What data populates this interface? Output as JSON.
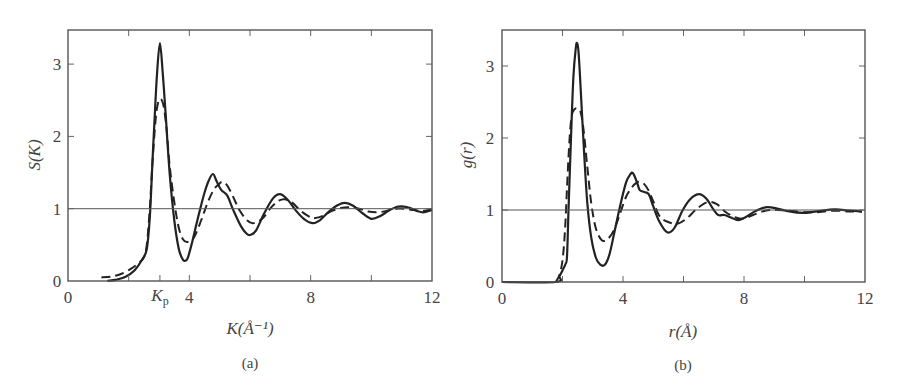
{
  "chart_data": [
    {
      "id": "a",
      "type": "line",
      "title": "",
      "caption": "(a)",
      "xlabel": "K(Å⁻¹)",
      "ylabel": "S(K)",
      "xlim": [
        0,
        12
      ],
      "ylim": [
        0,
        3.45
      ],
      "xticks": [
        0,
        4,
        8,
        12
      ],
      "xtick_labels": [
        "0",
        "4",
        "8",
        "12"
      ],
      "minor_xticks": [
        2,
        4,
        6,
        8,
        10
      ],
      "annotated_xtick": {
        "x": 3.03,
        "label": "K",
        "subscript": "p"
      },
      "yticks": [
        0,
        1,
        2,
        3
      ],
      "ytick_labels": [
        "0",
        "1",
        "2",
        "3"
      ],
      "reference_line": {
        "y": 1
      },
      "grid": false,
      "legend": null,
      "series": [
        {
          "name": "solid",
          "style": "solid",
          "x": [
            1.3,
            1.6,
            1.9,
            2.2,
            2.45,
            2.6,
            2.7,
            2.78,
            2.86,
            2.94,
            3.03,
            3.12,
            3.22,
            3.35,
            3.5,
            3.65,
            3.78,
            3.86,
            3.95,
            4.1,
            4.3,
            4.5,
            4.65,
            4.78,
            4.9,
            5.05,
            5.25,
            5.45,
            5.7,
            5.9,
            6.03,
            6.2,
            6.45,
            6.75,
            7.0,
            7.25,
            7.5,
            7.8,
            8.05,
            8.3,
            8.6,
            8.9,
            9.13,
            9.4,
            9.7,
            10.0,
            10.3,
            10.6,
            10.9,
            11.2,
            11.5,
            11.7,
            11.9,
            12.0
          ],
          "y": [
            0.0,
            0.02,
            0.06,
            0.15,
            0.3,
            0.45,
            0.9,
            1.6,
            2.3,
            2.9,
            3.29,
            2.9,
            2.3,
            1.5,
            0.85,
            0.45,
            0.3,
            0.28,
            0.32,
            0.55,
            0.9,
            1.22,
            1.4,
            1.48,
            1.38,
            1.26,
            1.18,
            0.98,
            0.76,
            0.65,
            0.64,
            0.7,
            0.92,
            1.14,
            1.2,
            1.12,
            0.98,
            0.85,
            0.8,
            0.84,
            0.96,
            1.05,
            1.08,
            1.04,
            0.94,
            0.86,
            0.9,
            0.98,
            1.03,
            1.02,
            0.97,
            0.95,
            0.97,
            0.98
          ]
        },
        {
          "name": "dashed",
          "style": "dashed",
          "x": [
            1.1,
            1.4,
            1.7,
            2.0,
            2.3,
            2.55,
            2.68,
            2.78,
            2.88,
            2.96,
            3.05,
            3.15,
            3.25,
            3.35,
            3.5,
            3.65,
            3.8,
            3.95,
            4.15,
            4.4,
            4.6,
            4.8,
            5.0,
            5.1,
            5.25,
            5.45,
            5.65,
            5.9,
            6.1,
            6.4,
            6.7,
            6.95,
            7.15,
            7.4,
            7.7,
            8.0,
            8.15,
            8.4,
            8.7,
            9.0,
            9.3,
            9.6,
            9.9,
            10.2,
            10.5,
            10.8,
            11.1,
            11.4,
            11.7,
            12.0
          ],
          "y": [
            0.05,
            0.06,
            0.09,
            0.15,
            0.24,
            0.38,
            0.9,
            1.6,
            2.2,
            2.45,
            2.52,
            2.42,
            2.1,
            1.6,
            1.1,
            0.74,
            0.57,
            0.54,
            0.6,
            0.85,
            1.08,
            1.26,
            1.35,
            1.37,
            1.32,
            1.16,
            0.98,
            0.84,
            0.8,
            0.86,
            1.02,
            1.11,
            1.13,
            1.08,
            0.96,
            0.88,
            0.87,
            0.9,
            0.97,
            1.01,
            1.02,
            1.0,
            0.96,
            0.95,
            0.97,
            1.0,
            1.0,
            0.98,
            0.97,
            0.99
          ]
        }
      ]
    },
    {
      "id": "b",
      "type": "line",
      "title": "",
      "caption": "(b)",
      "xlabel": "r(Å)",
      "ylabel": "g(r)",
      "xlim": [
        0,
        12
      ],
      "ylim": [
        0,
        3.45
      ],
      "xticks": [
        0,
        4,
        8,
        12
      ],
      "xtick_labels": [
        "0",
        "4",
        "8",
        "12"
      ],
      "minor_xticks": [
        2,
        4,
        6,
        8,
        10
      ],
      "yticks": [
        0,
        1,
        2,
        3
      ],
      "ytick_labels": [
        "0",
        "1",
        "2",
        "3"
      ],
      "reference_line": {
        "y": 1
      },
      "grid": false,
      "legend": null,
      "series": [
        {
          "name": "solid",
          "style": "solid",
          "x": [
            0.0,
            1.78,
            1.9,
            2.0,
            2.1,
            2.15,
            2.2,
            2.28,
            2.36,
            2.44,
            2.48,
            2.53,
            2.6,
            2.7,
            2.82,
            2.95,
            3.1,
            3.25,
            3.4,
            3.55,
            3.7,
            3.9,
            4.1,
            4.25,
            4.33,
            4.45,
            4.55,
            4.7,
            4.85,
            5.0,
            5.2,
            5.46,
            5.7,
            5.95,
            6.2,
            6.5,
            6.75,
            7.0,
            7.15,
            7.35,
            7.6,
            7.8,
            8.05,
            8.4,
            8.75,
            9.1,
            9.5,
            9.95,
            10.4,
            11.0,
            11.5,
            11.9
          ],
          "y": [
            0.0,
            0.0,
            0.08,
            0.16,
            0.25,
            0.35,
            1.0,
            2.0,
            2.85,
            3.25,
            3.32,
            3.2,
            2.7,
            1.9,
            1.1,
            0.62,
            0.34,
            0.24,
            0.24,
            0.38,
            0.66,
            1.05,
            1.38,
            1.5,
            1.51,
            1.4,
            1.28,
            1.25,
            1.22,
            1.05,
            0.84,
            0.69,
            0.75,
            0.98,
            1.14,
            1.22,
            1.16,
            1.0,
            0.93,
            0.93,
            0.89,
            0.86,
            0.9,
            0.99,
            1.04,
            1.02,
            0.98,
            0.96,
            0.98,
            1.01,
            0.99,
            0.98
          ]
        },
        {
          "name": "dashed",
          "style": "dashed",
          "x": [
            1.78,
            1.9,
            2.0,
            2.08,
            2.15,
            2.22,
            2.3,
            2.4,
            2.5,
            2.6,
            2.7,
            2.82,
            2.95,
            3.1,
            3.3,
            3.5,
            3.7,
            3.9,
            4.1,
            4.3,
            4.45,
            4.56,
            4.7,
            4.85,
            5.0,
            5.2,
            5.45,
            5.8,
            6.1,
            6.45,
            6.8,
            7.1,
            7.4,
            7.7,
            7.95,
            8.3,
            8.7,
            9.1,
            9.5,
            9.95,
            10.4,
            11.0,
            11.5,
            11.9
          ],
          "y": [
            0.0,
            0.1,
            0.3,
            0.7,
            1.3,
            1.9,
            2.3,
            2.4,
            2.4,
            2.36,
            2.1,
            1.6,
            1.1,
            0.75,
            0.58,
            0.6,
            0.72,
            0.95,
            1.18,
            1.32,
            1.38,
            1.39,
            1.36,
            1.27,
            1.12,
            0.92,
            0.84,
            0.81,
            0.88,
            1.02,
            1.11,
            1.08,
            0.97,
            0.9,
            0.88,
            0.93,
            0.99,
            1.0,
            0.99,
            0.97,
            0.97,
            0.99,
            0.98,
            0.98
          ]
        }
      ]
    }
  ]
}
